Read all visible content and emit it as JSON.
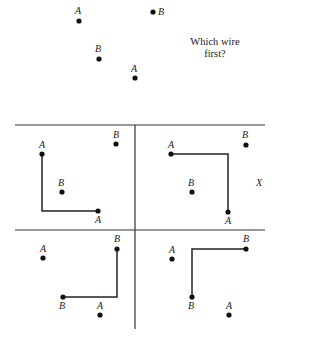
{
  "problem": {
    "question": "Which wire first?",
    "pins": [
      {
        "label": "A",
        "x": 79,
        "y": 21
      },
      {
        "label": "B",
        "x": 153,
        "y": 12
      },
      {
        "label": "B",
        "x": 99,
        "y": 59
      },
      {
        "label": "A",
        "x": 135,
        "y": 78
      }
    ]
  },
  "panels": [
    {
      "name": "top-left",
      "pins": [
        {
          "label": "A",
          "x": 42,
          "y": 154
        },
        {
          "label": "B",
          "x": 116,
          "y": 144
        },
        {
          "label": "B",
          "x": 62,
          "y": 192
        },
        {
          "label": "A",
          "x": 98,
          "y": 211
        }
      ],
      "wire": "A-A"
    },
    {
      "name": "top-right",
      "pins": [
        {
          "label": "A",
          "x": 171,
          "y": 154
        },
        {
          "label": "B",
          "x": 246,
          "y": 145
        },
        {
          "label": "B",
          "x": 192,
          "y": 192
        },
        {
          "label": "A",
          "x": 228,
          "y": 212
        }
      ],
      "wire": "A-A",
      "mark": "X"
    },
    {
      "name": "bottom-left",
      "pins": [
        {
          "label": "A",
          "x": 43,
          "y": 258
        },
        {
          "label": "B",
          "x": 117,
          "y": 249
        },
        {
          "label": "B",
          "x": 63,
          "y": 297
        },
        {
          "label": "A",
          "x": 100,
          "y": 315
        }
      ],
      "wire": "B-B"
    },
    {
      "name": "bottom-right",
      "pins": [
        {
          "label": "A",
          "x": 172,
          "y": 259
        },
        {
          "label": "B",
          "x": 246,
          "y": 249
        },
        {
          "label": "B",
          "x": 192,
          "y": 297
        },
        {
          "label": "A",
          "x": 229,
          "y": 315
        }
      ],
      "wire": "B-B"
    }
  ],
  "labels": {
    "tl_a1": "A",
    "tl_b1": "B",
    "tl_b2": "B",
    "tl_a2": "A",
    "tr_a1": "A",
    "tr_b1": "B",
    "tr_b2": "B",
    "tr_a2": "A",
    "tr_x": "X",
    "bl_a1": "A",
    "bl_b1": "B",
    "bl_b2": "B",
    "bl_a2": "A",
    "br_a1": "A",
    "br_b1": "B",
    "br_b2": "B",
    "br_a2": "A",
    "top_a1": "A",
    "top_b1": "B",
    "top_b2": "B",
    "top_a2": "A"
  }
}
